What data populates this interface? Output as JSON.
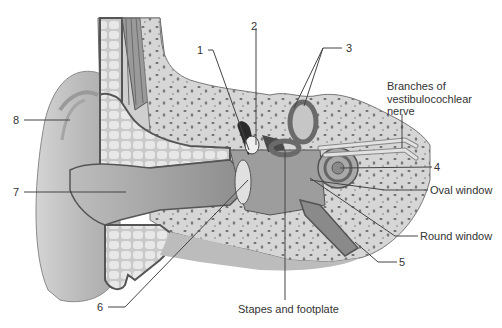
{
  "diagram": {
    "colors": {
      "background": "#ffffff",
      "skin_light": "#d9d9d9",
      "skin_mid": "#bdbdbd",
      "skin_dark": "#8f8f8f",
      "outline": "#555555",
      "bone": "#d6d6d6",
      "bone_spots": "#6b6b6b",
      "cartilage": "#e4e4e4",
      "canal": "#9c9c9c",
      "text": "#333333",
      "leader": "#444444"
    },
    "labels": [
      {
        "id": "1",
        "text": "1",
        "x": 197,
        "y": 46,
        "target": [
          249,
          150
        ]
      },
      {
        "id": "2",
        "text": "2",
        "x": 251,
        "y": 21,
        "target": [
          256,
          145
        ]
      },
      {
        "id": "3",
        "text": "3",
        "x": 346,
        "y": 44,
        "target": [
          [
            294,
            110
          ],
          [
            304,
            108
          ]
        ]
      },
      {
        "id": "4",
        "text": "4",
        "x": 434,
        "y": 164,
        "target": [
          340,
          168
        ]
      },
      {
        "id": "5",
        "text": "5",
        "x": 399,
        "y": 259,
        "target": [
          355,
          240
        ]
      },
      {
        "id": "6",
        "text": "6",
        "x": 97,
        "y": 305,
        "target": [
          248,
          180
        ]
      },
      {
        "id": "7",
        "text": "7",
        "x": 13,
        "y": 188,
        "target": [
          126,
          193
        ]
      },
      {
        "id": "8",
        "text": "8",
        "x": 13,
        "y": 116,
        "target": [
          70,
          120
        ]
      },
      {
        "id": "oval-window",
        "text": "Oval window",
        "x": 430,
        "y": 186,
        "target": [
          310,
          182
        ]
      },
      {
        "id": "round-window",
        "text": "Round window",
        "x": 420,
        "y": 232,
        "target": [
          310,
          178
        ]
      },
      {
        "id": "stapes",
        "text": "Stapes and footplate",
        "x": 238,
        "y": 306,
        "target": [
          285,
          150
        ]
      },
      {
        "id": "nerve",
        "text": "Branches of\nvestibulocochlear\nnerve",
        "x": 387,
        "y": 87,
        "target": [
          402,
          148
        ]
      }
    ]
  }
}
